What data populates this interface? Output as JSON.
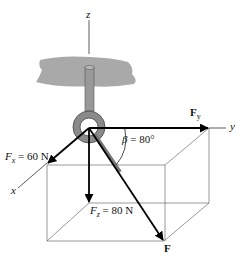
{
  "diagram": {
    "axes": {
      "x": "x",
      "y": "y",
      "z": "z"
    },
    "forces": {
      "Fx": {
        "symbol": "F",
        "sub": "x",
        "value": "= 60 N"
      },
      "Fy": {
        "symbol": "F",
        "sub": "y"
      },
      "Fz": {
        "symbol": "F",
        "sub": "z",
        "value": "= 80 N"
      },
      "F": {
        "symbol": "F"
      }
    },
    "angle": {
      "symbol": "β",
      "value": "= 80°"
    },
    "colors": {
      "arrow": "#000000",
      "ceiling": "#a9a9a9",
      "ring": "#8a8a8a",
      "box": "#555555"
    }
  }
}
